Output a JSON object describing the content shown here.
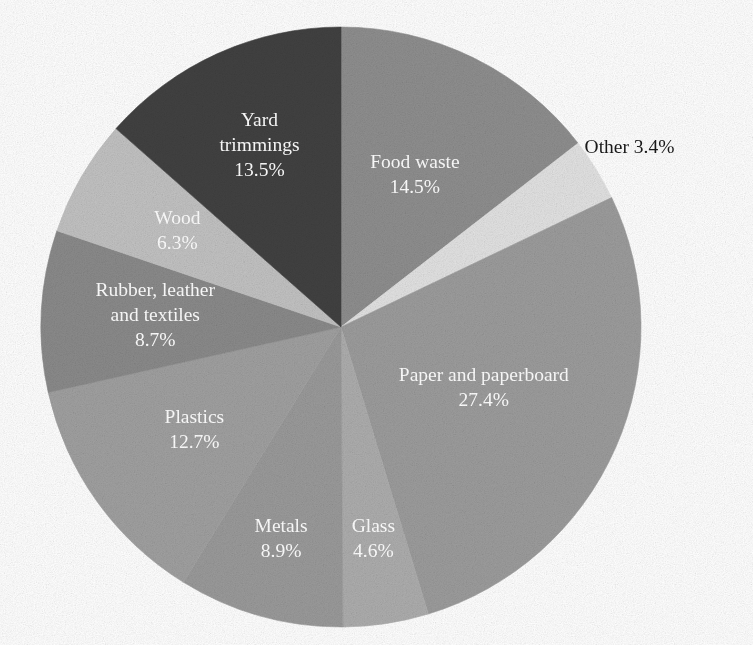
{
  "chart_data": {
    "type": "pie",
    "title": "",
    "subtitle": "",
    "xlabel": "",
    "ylabel": "",
    "legend_position": "none",
    "grid": false,
    "value_unit": "%",
    "start_angle_deg": 0,
    "direction": "clockwise",
    "total": 100.0,
    "categories": [
      "Food waste",
      "Other",
      "Paper and paperboard",
      "Glass",
      "Metals",
      "Plastics",
      "Rubber, leather and textiles",
      "Wood",
      "Yard trimmings"
    ],
    "values": [
      14.5,
      3.4,
      27.4,
      4.6,
      8.9,
      12.7,
      8.7,
      6.3,
      13.5
    ],
    "slices": [
      {
        "name": "Food waste",
        "value": 14.5,
        "value_label": "14.5%",
        "label_lines": [
          "Food waste",
          "14.5%"
        ],
        "color": "#8e8e8e",
        "label_color": "#ffffff",
        "label_placement": "inside"
      },
      {
        "name": "Other",
        "value": 3.4,
        "value_label": "3.4%",
        "label_lines": [
          "Other 3.4%"
        ],
        "color": "#e2e2e2",
        "label_color": "#1a1a1a",
        "label_placement": "outside"
      },
      {
        "name": "Paper and paperboard",
        "value": 27.4,
        "value_label": "27.4%",
        "label_lines": [
          "Paper and paperboard",
          "27.4%"
        ],
        "color": "#9c9c9c",
        "label_color": "#ffffff",
        "label_placement": "inside"
      },
      {
        "name": "Glass",
        "value": 4.6,
        "value_label": "4.6%",
        "label_lines": [
          "Glass",
          "4.6%"
        ],
        "color": "#adadad",
        "label_color": "#ffffff",
        "label_placement": "inside"
      },
      {
        "name": "Metals",
        "value": 8.9,
        "value_label": "8.9%",
        "label_lines": [
          "Metals",
          "8.9%"
        ],
        "color": "#9a9a9a",
        "label_color": "#ffffff",
        "label_placement": "inside"
      },
      {
        "name": "Plastics",
        "value": 12.7,
        "value_label": "12.7%",
        "label_lines": [
          "Plastics",
          "12.7%"
        ],
        "color": "#a0a0a0",
        "label_color": "#ffffff",
        "label_placement": "inside"
      },
      {
        "name": "Rubber, leather and textiles",
        "value": 8.7,
        "value_label": "8.7%",
        "label_lines": [
          "Rubber, leather",
          "and textiles",
          "8.7%"
        ],
        "color": "#8a8a8a",
        "label_color": "#ffffff",
        "label_placement": "inside"
      },
      {
        "name": "Wood",
        "value": 6.3,
        "value_label": "6.3%",
        "label_lines": [
          "Wood",
          "6.3%"
        ],
        "color": "#c2c2c2",
        "label_color": "#ffffff",
        "label_placement": "inside"
      },
      {
        "name": "Yard trimmings",
        "value": 13.5,
        "value_label": "13.5%",
        "label_lines": [
          "Yard",
          "trimmings",
          "13.5%"
        ],
        "color": "#414141",
        "label_color": "#ffffff",
        "label_placement": "inside"
      }
    ]
  },
  "figure": {
    "background": "#ffffff",
    "center_x": 341,
    "center_y": 327,
    "radius": 300
  }
}
